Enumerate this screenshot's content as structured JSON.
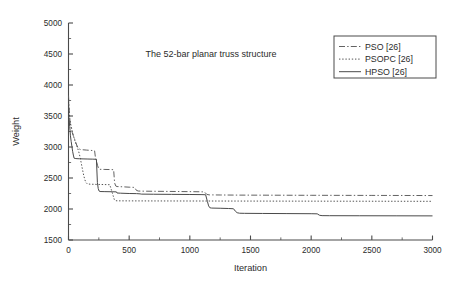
{
  "chart_data": {
    "type": "line",
    "title": "",
    "annotation": "The 52-bar planar truss structure",
    "xlabel": "Iteration",
    "ylabel": "Weight",
    "xlim": [
      0,
      3000
    ],
    "ylim": [
      1500,
      5000
    ],
    "xticks": [
      0,
      500,
      1000,
      1500,
      2000,
      2500,
      3000
    ],
    "xticklabels": [
      "0",
      "500",
      "1000",
      "1500",
      "2000",
      "2500",
      "3000"
    ],
    "yticks": [
      1500,
      2000,
      2500,
      3000,
      3500,
      4000,
      4500,
      5000
    ],
    "yticklabels": [
      "1500",
      "2000",
      "2500",
      "3000",
      "3500",
      "4000",
      "4500",
      "5000"
    ],
    "x_minor_interval": 250,
    "y_minor_interval": 250,
    "grid": false,
    "legend_position": "upper right",
    "series": [
      {
        "name": "PSO [26]",
        "style": "dashdot",
        "color": "#5a5a5a",
        "points": [
          [
            0,
            3830
          ],
          [
            8,
            3520
          ],
          [
            14,
            3380
          ],
          [
            22,
            3310
          ],
          [
            30,
            3240
          ],
          [
            40,
            3180
          ],
          [
            52,
            3120
          ],
          [
            64,
            3050
          ],
          [
            78,
            2985
          ],
          [
            95,
            2960
          ],
          [
            120,
            2955
          ],
          [
            150,
            2950
          ],
          [
            185,
            2945
          ],
          [
            215,
            2940
          ],
          [
            222,
            2830
          ],
          [
            232,
            2760
          ],
          [
            240,
            2700
          ],
          [
            248,
            2655
          ],
          [
            255,
            2640
          ],
          [
            300,
            2638
          ],
          [
            350,
            2636
          ],
          [
            372,
            2634
          ],
          [
            380,
            2420
          ],
          [
            390,
            2370
          ],
          [
            400,
            2362
          ],
          [
            450,
            2358
          ],
          [
            500,
            2352
          ],
          [
            545,
            2348
          ],
          [
            560,
            2300
          ],
          [
            575,
            2290
          ],
          [
            600,
            2288
          ],
          [
            700,
            2286
          ],
          [
            800,
            2284
          ],
          [
            900,
            2282
          ],
          [
            1000,
            2280
          ],
          [
            1080,
            2278
          ],
          [
            1120,
            2276
          ],
          [
            1140,
            2235
          ],
          [
            1160,
            2228
          ],
          [
            1250,
            2226
          ],
          [
            1400,
            2224
          ],
          [
            1600,
            2223
          ],
          [
            1800,
            2222
          ],
          [
            2000,
            2221
          ],
          [
            2250,
            2220
          ],
          [
            2500,
            2219
          ],
          [
            2750,
            2218
          ],
          [
            3000,
            2217
          ]
        ]
      },
      {
        "name": "PSOPC [26]",
        "style": "dotted",
        "color": "#4a4a4a",
        "points": [
          [
            0,
            3780
          ],
          [
            6,
            3560
          ],
          [
            12,
            3430
          ],
          [
            20,
            3350
          ],
          [
            28,
            3280
          ],
          [
            38,
            3200
          ],
          [
            48,
            3130
          ],
          [
            60,
            3060
          ],
          [
            72,
            3000
          ],
          [
            85,
            2920
          ],
          [
            95,
            2840
          ],
          [
            105,
            2740
          ],
          [
            115,
            2640
          ],
          [
            125,
            2545
          ],
          [
            135,
            2470
          ],
          [
            145,
            2425
          ],
          [
            155,
            2405
          ],
          [
            180,
            2400
          ],
          [
            210,
            2398
          ],
          [
            250,
            2396
          ],
          [
            300,
            2394
          ],
          [
            340,
            2392
          ],
          [
            355,
            2300
          ],
          [
            368,
            2215
          ],
          [
            378,
            2150
          ],
          [
            388,
            2135
          ],
          [
            400,
            2132
          ],
          [
            500,
            2131
          ],
          [
            700,
            2130
          ],
          [
            1000,
            2129
          ],
          [
            1400,
            2128
          ],
          [
            1800,
            2127
          ],
          [
            2200,
            2126
          ],
          [
            2600,
            2125
          ],
          [
            3000,
            2124
          ]
        ]
      },
      {
        "name": "HPSO [26]",
        "style": "solid",
        "color": "#4a4a4a",
        "points": [
          [
            0,
            3500
          ],
          [
            5,
            3440
          ],
          [
            10,
            3330
          ],
          [
            16,
            3180
          ],
          [
            22,
            3090
          ],
          [
            28,
            3010
          ],
          [
            34,
            2930
          ],
          [
            40,
            2870
          ],
          [
            46,
            2820
          ],
          [
            55,
            2815
          ],
          [
            70,
            2812
          ],
          [
            90,
            2810
          ],
          [
            120,
            2808
          ],
          [
            160,
            2806
          ],
          [
            200,
            2804
          ],
          [
            230,
            2802
          ],
          [
            238,
            2430
          ],
          [
            245,
            2330
          ],
          [
            252,
            2290
          ],
          [
            260,
            2282
          ],
          [
            300,
            2280
          ],
          [
            360,
            2278
          ],
          [
            395,
            2276
          ],
          [
            400,
            2258
          ],
          [
            430,
            2255
          ],
          [
            500,
            2250
          ],
          [
            560,
            2248
          ],
          [
            590,
            2244
          ],
          [
            600,
            2240
          ],
          [
            700,
            2238
          ],
          [
            850,
            2236
          ],
          [
            1000,
            2234
          ],
          [
            1100,
            2232
          ],
          [
            1130,
            2230
          ],
          [
            1145,
            2120
          ],
          [
            1155,
            2050
          ],
          [
            1165,
            2020
          ],
          [
            1180,
            2015
          ],
          [
            1250,
            2012
          ],
          [
            1320,
            2008
          ],
          [
            1360,
            2004
          ],
          [
            1375,
            1965
          ],
          [
            1390,
            1940
          ],
          [
            1410,
            1932
          ],
          [
            1450,
            1930
          ],
          [
            1600,
            1928
          ],
          [
            1800,
            1926
          ],
          [
            2000,
            1924
          ],
          [
            2050,
            1922
          ],
          [
            2070,
            1898
          ],
          [
            2090,
            1893
          ],
          [
            2150,
            1892
          ],
          [
            2400,
            1891
          ],
          [
            2700,
            1890
          ],
          [
            3000,
            1889
          ]
        ]
      }
    ]
  },
  "legend": {
    "entries": [
      {
        "label": "PSO [26]"
      },
      {
        "label": "PSOPC [26]"
      },
      {
        "label": "HPSO [26]"
      }
    ]
  }
}
